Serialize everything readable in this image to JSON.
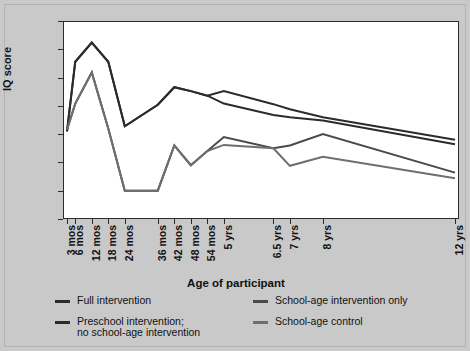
{
  "chart_data": {
    "type": "line",
    "title": "",
    "xlabel": "Age of participant",
    "ylabel": "IQ score",
    "ylim": [
      80,
      115
    ],
    "yticks": [
      80,
      85,
      90,
      95,
      100,
      105,
      110,
      115
    ],
    "grid": false,
    "legend_position": "bottom",
    "categories": [
      "3 mos",
      "6 mos",
      "12 mos",
      "18 mos",
      "24 mos",
      "36 mos",
      "42 mos",
      "48 mos",
      "54 mos",
      "5 yrs",
      "6.5 yrs",
      "7 yrs",
      "8 yrs",
      "12 yrs"
    ],
    "x_positions_months": [
      3,
      6,
      12,
      18,
      24,
      36,
      42,
      48,
      54,
      60,
      78,
      84,
      96,
      144
    ],
    "series": [
      {
        "name": "Full intervention",
        "color": "#2b2b2b",
        "values": [
          95.5,
          107.8,
          111.2,
          107.8,
          96.4,
          100.2,
          103.3,
          102.6,
          101.8,
          102.6,
          100.3,
          99.4,
          98.0,
          94.0
        ]
      },
      {
        "name": "Preschool intervention; no school-age intervention",
        "color": "#2b2b2b",
        "values": [
          95.5,
          107.8,
          111.2,
          107.8,
          96.4,
          100.2,
          103.3,
          102.6,
          101.8,
          100.4,
          98.4,
          98.0,
          97.4,
          93.2
        ]
      },
      {
        "name": "School-age intervention only",
        "color": "#4a4a4a",
        "values": [
          95.8,
          100.4,
          105.9,
          96.0,
          85.0,
          85.0,
          93.0,
          89.5,
          92.0,
          94.5,
          92.5,
          93.0,
          95.0,
          88.2
        ]
      },
      {
        "name": "School-age control",
        "color": "#6e6e6e",
        "values": [
          95.8,
          100.4,
          105.9,
          96.0,
          85.0,
          85.0,
          93.0,
          89.5,
          92.0,
          93.1,
          92.5,
          89.4,
          91.0,
          87.2
        ]
      }
    ]
  },
  "legend": {
    "items": [
      {
        "label": "Full intervention",
        "color": "#2b2b2b"
      },
      {
        "label": "School-age intervention only",
        "color": "#4a4a4a"
      },
      {
        "label": "Preschool intervention;\nno school-age intervention",
        "color": "#2b2b2b"
      },
      {
        "label": "School-age control",
        "color": "#6e6e6e"
      }
    ]
  }
}
